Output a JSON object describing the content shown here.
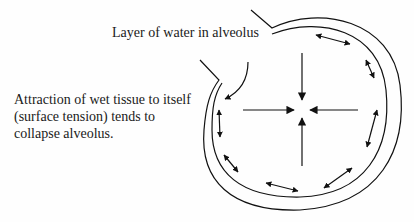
{
  "diagram": {
    "labels": {
      "water_layer": "Layer of water in alveolus",
      "attraction": "Attraction of wet tissue to itself (surface tension) tends to collapse alveolus."
    },
    "elements": {
      "outer_wall": "alveolar wall (outer line)",
      "inner_wall": "water layer boundary (inner line)",
      "inward_arrows": [
        "top",
        "left",
        "right",
        "bottom"
      ],
      "tangential_double_arrows": 8
    },
    "colors": {
      "line": "#111111",
      "background": "#ffffff",
      "text": "#1a1a1a"
    }
  }
}
